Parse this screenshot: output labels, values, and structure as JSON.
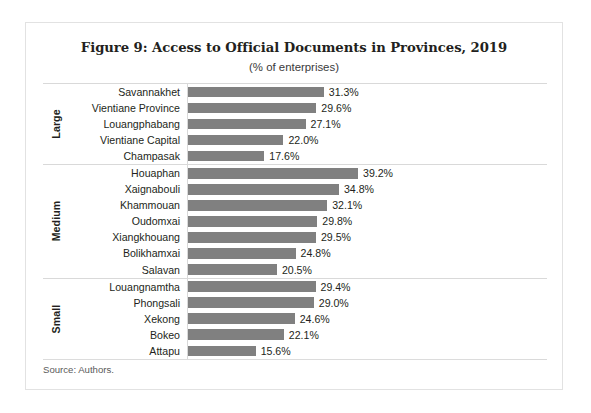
{
  "figure": {
    "title": "Figure 9: Access to Official Documents in Provinces, 2019",
    "subtitle": "(% of enterprises)",
    "source": "Source: Authors."
  },
  "chart_data": {
    "type": "bar",
    "orientation": "horizontal",
    "title": "Figure 9: Access to Official Documents in Provinces, 2019",
    "subtitle": "(% of enterprises)",
    "xlabel": "",
    "ylabel": "",
    "xlim": [
      0,
      39.2
    ],
    "grid": false,
    "legend": false,
    "bar_color": "#808080",
    "value_suffix": "%",
    "groups": [
      {
        "name": "Large",
        "categories": [
          "Savannakhet",
          "Vientiane Province",
          "Louangphabang",
          "Vientiane Capital",
          "Champasak"
        ],
        "values": [
          31.3,
          29.6,
          27.1,
          22.0,
          17.6
        ],
        "labels": [
          "31.3%",
          "29.6%",
          "27.1%",
          "22.0%",
          "17.6%"
        ]
      },
      {
        "name": "Medium",
        "categories": [
          "Houaphan",
          "Xaignabouli",
          "Khammouan",
          "Oudomxai",
          "Xiangkhouang",
          "Bolikhamxai",
          "Salavan"
        ],
        "values": [
          39.2,
          34.8,
          32.1,
          29.8,
          29.5,
          24.8,
          20.5
        ],
        "labels": [
          "39.2%",
          "34.8%",
          "32.1%",
          "29.8%",
          "29.5%",
          "24.8%",
          "20.5%"
        ]
      },
      {
        "name": "Small",
        "categories": [
          "Louangnamtha",
          "Phongsali",
          "Xekong",
          "Bokeo",
          "Attapu"
        ],
        "values": [
          29.4,
          29.0,
          24.6,
          22.1,
          15.6
        ],
        "labels": [
          "29.4%",
          "29.0%",
          "24.6%",
          "22.1%",
          "15.6%"
        ]
      }
    ],
    "categories": [
      "Savannakhet",
      "Vientiane Province",
      "Louangphabang",
      "Vientiane Capital",
      "Champasak",
      "Houaphan",
      "Xaignabouli",
      "Khammouan",
      "Oudomxai",
      "Xiangkhouang",
      "Bolikhamxai",
      "Salavan",
      "Louangnamtha",
      "Phongsali",
      "Xekong",
      "Bokeo",
      "Attapu"
    ],
    "values": [
      31.3,
      29.6,
      27.1,
      22.0,
      17.6,
      39.2,
      34.8,
      32.1,
      29.8,
      29.5,
      24.8,
      20.5,
      29.4,
      29.0,
      24.6,
      22.1,
      15.6
    ]
  }
}
